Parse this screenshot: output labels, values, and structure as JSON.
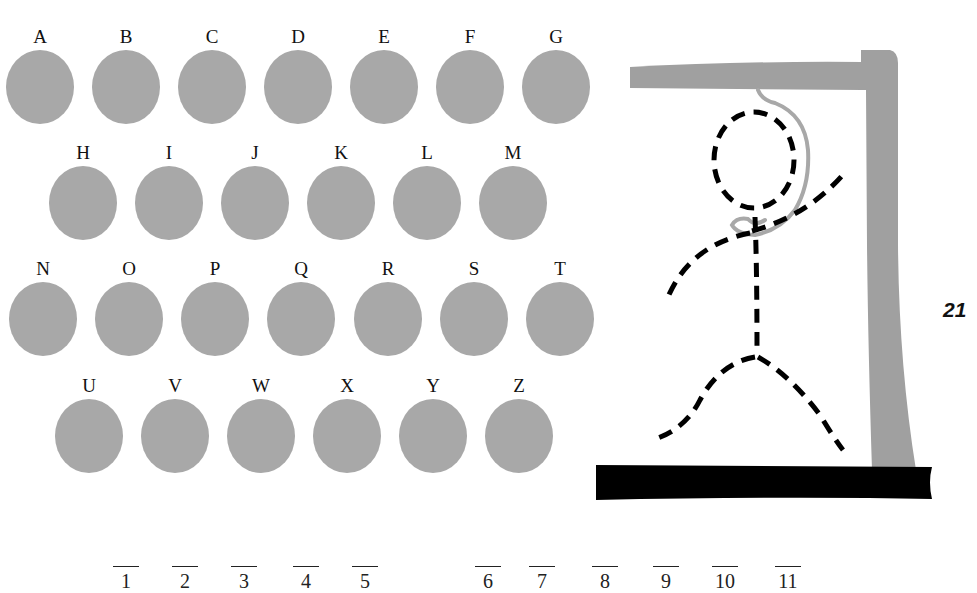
{
  "letters": {
    "row1": [
      "A",
      "B",
      "C",
      "D",
      "E",
      "F",
      "G"
    ],
    "row2": [
      "H",
      "I",
      "J",
      "K",
      "L",
      "M"
    ],
    "row3": [
      "N",
      "O",
      "P",
      "Q",
      "R",
      "S",
      "T"
    ],
    "row4": [
      "U",
      "V",
      "W",
      "X",
      "Y",
      "Z"
    ]
  },
  "blanks": [
    "1",
    "2",
    "3",
    "4",
    "5",
    "6",
    "7",
    "8",
    "9",
    "10",
    "11"
  ],
  "counter": "21",
  "colors": {
    "disc": "#a8a8a8",
    "gallows": "#a0a0a0",
    "base": "#000000",
    "figure": "#000000"
  }
}
